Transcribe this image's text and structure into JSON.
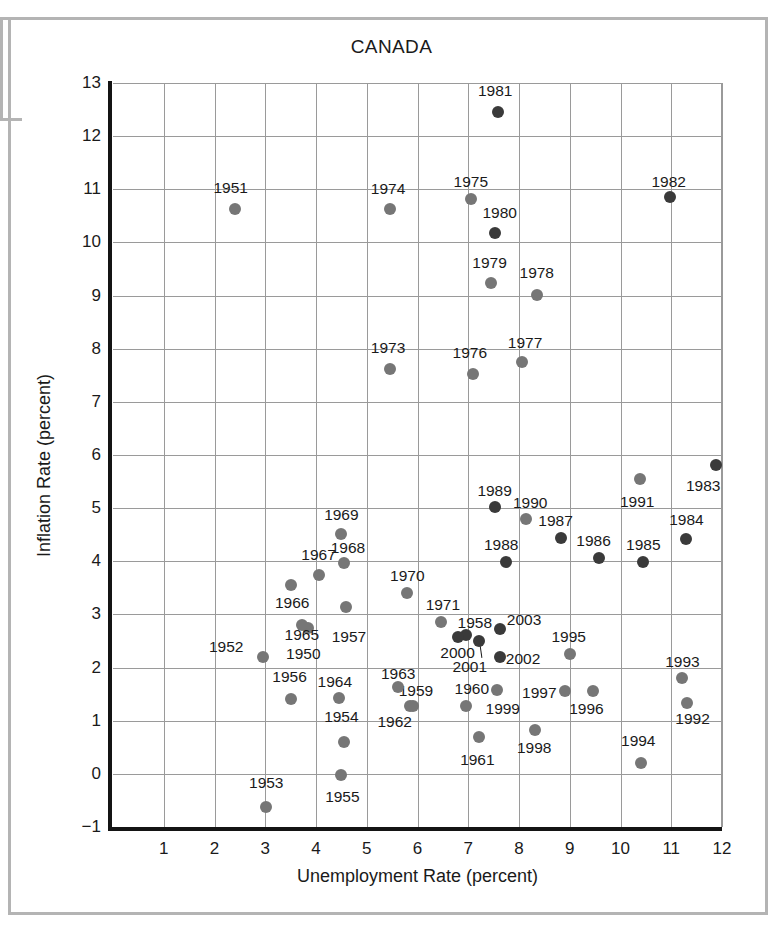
{
  "chart_data": {
    "type": "scatter",
    "title": "CANADA",
    "xlabel": "Unemployment Rate (percent)",
    "ylabel": "Inflation Rate (percent)",
    "xlim": [
      0,
      12
    ],
    "ylim": [
      -1,
      13
    ],
    "xticks": [
      1,
      2,
      3,
      4,
      5,
      6,
      7,
      8,
      9,
      10,
      11,
      12
    ],
    "yticks": [
      -1,
      0,
      1,
      2,
      3,
      4,
      5,
      6,
      7,
      8,
      9,
      10,
      11,
      12,
      13
    ],
    "grid": true,
    "legend": "none",
    "point_colors": {
      "light": "#767676",
      "dark": "#3a3a3a"
    },
    "points": [
      {
        "label": "1950",
        "x": 3.85,
        "y": 2.75,
        "shade": "light",
        "lx": 3.75,
        "ly": 2.25
      },
      {
        "label": "1951",
        "x": 2.4,
        "y": 10.62,
        "shade": "light",
        "lx": 2.32,
        "ly": 11.02
      },
      {
        "label": "1952",
        "x": 2.95,
        "y": 2.2,
        "shade": "light",
        "lx": 2.23,
        "ly": 2.38
      },
      {
        "label": "1953",
        "x": 3.02,
        "y": -0.62,
        "shade": "light",
        "lx": 3.02,
        "ly": -0.17
      },
      {
        "label": "1954",
        "x": 4.55,
        "y": 0.6,
        "shade": "light",
        "lx": 4.5,
        "ly": 1.07
      },
      {
        "label": "1955",
        "x": 4.5,
        "y": -0.02,
        "shade": "light",
        "lx": 4.52,
        "ly": -0.44
      },
      {
        "label": "1956",
        "x": 3.5,
        "y": 1.4,
        "shade": "light",
        "lx": 3.48,
        "ly": 1.82
      },
      {
        "label": "1957",
        "x": 4.6,
        "y": 3.14,
        "shade": "light",
        "lx": 4.65,
        "ly": 2.58
      },
      {
        "label": "1958",
        "x": 6.95,
        "y": 2.62,
        "shade": "dark",
        "lx": 7.13,
        "ly": 2.84
      },
      {
        "label": "1959",
        "x": 5.85,
        "y": 1.27,
        "shade": "light",
        "lx": 5.97,
        "ly": 1.55
      },
      {
        "label": "1960",
        "x": 6.95,
        "y": 1.28,
        "shade": "light",
        "lx": 7.07,
        "ly": 1.59
      },
      {
        "label": "1961",
        "x": 7.22,
        "y": 0.7,
        "shade": "light",
        "lx": 7.18,
        "ly": 0.27
      },
      {
        "label": "1962",
        "x": 5.92,
        "y": 1.27,
        "shade": "light",
        "lx": 5.55,
        "ly": 0.98
      },
      {
        "label": "1963",
        "x": 5.62,
        "y": 1.63,
        "shade": "light",
        "lx": 5.62,
        "ly": 1.88
      },
      {
        "label": "1964",
        "x": 4.45,
        "y": 1.43,
        "shade": "light",
        "lx": 4.37,
        "ly": 1.73
      },
      {
        "label": "1965",
        "x": 3.72,
        "y": 2.8,
        "shade": "light",
        "lx": 3.72,
        "ly": 2.62
      },
      {
        "label": "1966",
        "x": 3.5,
        "y": 3.55,
        "shade": "light",
        "lx": 3.53,
        "ly": 3.22
      },
      {
        "label": "1967",
        "x": 4.05,
        "y": 3.75,
        "shade": "light",
        "lx": 4.05,
        "ly": 4.12
      },
      {
        "label": "1968",
        "x": 4.55,
        "y": 3.97,
        "shade": "light",
        "lx": 4.63,
        "ly": 4.25
      },
      {
        "label": "1969",
        "x": 4.5,
        "y": 4.52,
        "shade": "light",
        "lx": 4.5,
        "ly": 4.87
      },
      {
        "label": "1970",
        "x": 5.8,
        "y": 3.4,
        "shade": "light",
        "lx": 5.8,
        "ly": 3.73
      },
      {
        "label": "1971",
        "x": 6.47,
        "y": 2.85,
        "shade": "light",
        "lx": 6.5,
        "ly": 3.17
      },
      {
        "label": "1973",
        "x": 5.45,
        "y": 7.62,
        "shade": "light",
        "lx": 5.42,
        "ly": 8.02
      },
      {
        "label": "1974",
        "x": 5.45,
        "y": 10.62,
        "shade": "light",
        "lx": 5.42,
        "ly": 11.0
      },
      {
        "label": "1975",
        "x": 7.05,
        "y": 10.82,
        "shade": "light",
        "lx": 7.05,
        "ly": 11.13
      },
      {
        "label": "1976",
        "x": 7.1,
        "y": 7.52,
        "shade": "light",
        "lx": 7.03,
        "ly": 7.92
      },
      {
        "label": "1977",
        "x": 8.05,
        "y": 7.75,
        "shade": "light",
        "lx": 8.12,
        "ly": 8.1
      },
      {
        "label": "1978",
        "x": 8.35,
        "y": 9.02,
        "shade": "light",
        "lx": 8.35,
        "ly": 9.43
      },
      {
        "label": "1979",
        "x": 7.45,
        "y": 9.23,
        "shade": "light",
        "lx": 7.42,
        "ly": 9.62
      },
      {
        "label": "1980",
        "x": 7.52,
        "y": 10.18,
        "shade": "dark",
        "lx": 7.62,
        "ly": 10.55
      },
      {
        "label": "1981",
        "x": 7.58,
        "y": 12.45,
        "shade": "dark",
        "lx": 7.53,
        "ly": 12.85
      },
      {
        "label": "1982",
        "x": 10.97,
        "y": 10.85,
        "shade": "dark",
        "lx": 10.95,
        "ly": 11.13
      },
      {
        "label": "1983",
        "x": 11.88,
        "y": 5.82,
        "shade": "dark",
        "lx": 11.63,
        "ly": 5.42
      },
      {
        "label": "1984",
        "x": 11.3,
        "y": 4.42,
        "shade": "dark",
        "lx": 11.3,
        "ly": 4.78
      },
      {
        "label": "1985",
        "x": 10.45,
        "y": 3.98,
        "shade": "dark",
        "lx": 10.45,
        "ly": 4.3
      },
      {
        "label": "1986",
        "x": 9.58,
        "y": 4.07,
        "shade": "dark",
        "lx": 9.47,
        "ly": 4.38
      },
      {
        "label": "1987",
        "x": 8.82,
        "y": 4.43,
        "shade": "dark",
        "lx": 8.72,
        "ly": 4.75
      },
      {
        "label": "1988",
        "x": 7.75,
        "y": 3.98,
        "shade": "dark",
        "lx": 7.65,
        "ly": 4.3
      },
      {
        "label": "1989",
        "x": 7.52,
        "y": 5.02,
        "shade": "dark",
        "lx": 7.52,
        "ly": 5.32
      },
      {
        "label": "1990",
        "x": 8.13,
        "y": 4.8,
        "shade": "light",
        "lx": 8.22,
        "ly": 5.1
      },
      {
        "label": "1991",
        "x": 10.38,
        "y": 5.55,
        "shade": "light",
        "lx": 10.33,
        "ly": 5.12
      },
      {
        "label": "1992",
        "x": 11.32,
        "y": 1.33,
        "shade": "light",
        "lx": 11.42,
        "ly": 1.03
      },
      {
        "label": "1993",
        "x": 11.22,
        "y": 1.8,
        "shade": "light",
        "lx": 11.22,
        "ly": 2.1
      },
      {
        "label": "1994",
        "x": 10.4,
        "y": 0.2,
        "shade": "light",
        "lx": 10.35,
        "ly": 0.62
      },
      {
        "label": "1995",
        "x": 9.0,
        "y": 2.25,
        "shade": "light",
        "lx": 8.98,
        "ly": 2.58
      },
      {
        "label": "1996",
        "x": 9.45,
        "y": 1.55,
        "shade": "light",
        "lx": 9.33,
        "ly": 1.22
      },
      {
        "label": "1997",
        "x": 8.9,
        "y": 1.55,
        "shade": "light",
        "lx": 8.4,
        "ly": 1.52
      },
      {
        "label": "1998",
        "x": 8.32,
        "y": 0.83,
        "shade": "light",
        "lx": 8.3,
        "ly": 0.48
      },
      {
        "label": "1999",
        "x": 7.57,
        "y": 1.58,
        "shade": "light",
        "lx": 7.68,
        "ly": 1.22
      },
      {
        "label": "2000",
        "x": 6.8,
        "y": 2.58,
        "shade": "dark",
        "lx": 6.79,
        "ly": 2.27
      },
      {
        "label": "2001",
        "x": 7.22,
        "y": 2.5,
        "shade": "dark",
        "lx": 7.03,
        "ly": 2.02
      },
      {
        "label": "2002",
        "x": 7.62,
        "y": 2.2,
        "shade": "dark",
        "lx": 8.08,
        "ly": 2.17
      },
      {
        "label": "2003",
        "x": 7.62,
        "y": 2.73,
        "shade": "dark",
        "lx": 8.1,
        "ly": 2.9
      }
    ]
  }
}
